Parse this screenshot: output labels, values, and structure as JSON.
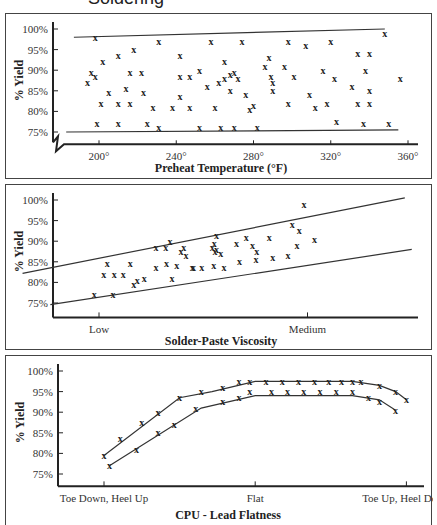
{
  "page": {
    "title": "Soldering"
  },
  "chart_data": [
    {
      "type": "scatter",
      "title": "",
      "xlabel": "Preheat Temperature (°F)",
      "ylabel": "% Yield",
      "xlim": [
        180,
        365
      ],
      "ylim": [
        72,
        100
      ],
      "x_ticks": [
        "200°",
        "240°",
        "280°",
        "320°",
        "360°"
      ],
      "y_ticks": [
        "100%",
        "95%",
        "90%",
        "85%",
        "80%",
        "75%"
      ],
      "marker": "x",
      "bounds": [
        {
          "name": "upper",
          "points": [
            [
              187,
              98
            ],
            [
              348,
              100
            ]
          ]
        },
        {
          "name": "lower",
          "points": [
            [
              183,
              75
            ],
            [
              355,
              75.5
            ]
          ]
        }
      ],
      "points": [
        [
          198,
          98
        ],
        [
          196,
          89.5
        ],
        [
          194,
          87
        ],
        [
          198,
          88.5
        ],
        [
          202,
          92
        ],
        [
          201,
          82
        ],
        [
          199,
          77
        ],
        [
          205,
          84.5
        ],
        [
          210,
          93.5
        ],
        [
          210,
          82
        ],
        [
          210,
          77
        ],
        [
          216,
          89.5
        ],
        [
          218,
          95
        ],
        [
          214,
          85.5
        ],
        [
          216,
          82
        ],
        [
          222,
          89.5
        ],
        [
          223,
          84.5
        ],
        [
          225,
          77
        ],
        [
          228,
          81
        ],
        [
          231,
          97
        ],
        [
          231,
          76
        ],
        [
          238,
          81
        ],
        [
          242,
          88.5
        ],
        [
          242,
          83.5
        ],
        [
          242,
          93.5
        ],
        [
          247,
          88.5
        ],
        [
          247,
          81
        ],
        [
          252,
          90
        ],
        [
          252,
          76
        ],
        [
          256,
          86
        ],
        [
          258,
          97
        ],
        [
          260,
          81
        ],
        [
          265,
          92
        ],
        [
          262,
          87
        ],
        [
          263,
          76
        ],
        [
          265,
          88
        ],
        [
          268,
          89
        ],
        [
          268,
          85
        ],
        [
          270,
          89.5
        ],
        [
          270,
          76
        ],
        [
          272,
          88
        ],
        [
          274,
          97
        ],
        [
          276,
          84
        ],
        [
          278,
          80.5
        ],
        [
          280,
          81.5
        ],
        [
          282,
          76
        ],
        [
          286,
          91
        ],
        [
          289,
          88.5
        ],
        [
          288,
          93
        ],
        [
          290,
          87
        ],
        [
          290,
          85
        ],
        [
          296,
          91
        ],
        [
          298,
          97
        ],
        [
          298,
          82
        ],
        [
          301,
          88.5
        ],
        [
          307,
          96
        ],
        [
          309,
          84
        ],
        [
          312,
          81
        ],
        [
          316,
          90
        ],
        [
          320,
          97
        ],
        [
          318,
          82
        ],
        [
          322,
          88
        ],
        [
          323,
          77.5
        ],
        [
          331,
          86
        ],
        [
          334,
          94
        ],
        [
          334,
          82
        ],
        [
          337,
          77
        ],
        [
          338,
          90
        ],
        [
          340,
          94
        ],
        [
          340,
          85
        ],
        [
          340,
          82
        ],
        [
          348,
          99
        ],
        [
          350,
          77
        ],
        [
          356,
          88
        ]
      ]
    },
    {
      "type": "scatter",
      "title": "",
      "xlabel": "Solder-Paste Viscosity",
      "ylabel": "% Yield",
      "x_ticks": [
        "Low",
        "Medium",
        "High"
      ],
      "y_ticks": [
        "100%",
        "95%",
        "90%",
        "85%",
        "80%",
        "75%"
      ],
      "ylim": [
        72,
        100
      ],
      "xlim": [
        -0.6,
        2.35
      ],
      "marker": "x",
      "bounds": [
        {
          "name": "upper",
          "points": [
            [
              -0.55,
              82.2
            ],
            [
              2.2,
              100.5
            ]
          ]
        },
        {
          "name": "lower",
          "points": [
            [
              -0.35,
              74.6
            ],
            [
              2.25,
              88
            ]
          ]
        }
      ],
      "points": [
        [
          -0.07,
          77
        ],
        [
          0.07,
          82
        ],
        [
          0.12,
          84.5
        ],
        [
          0.2,
          77
        ],
        [
          0.22,
          82
        ],
        [
          0.35,
          82
        ],
        [
          0.45,
          84.5
        ],
        [
          0.5,
          79.5
        ],
        [
          0.55,
          80.5
        ],
        [
          0.65,
          81
        ],
        [
          0.82,
          88.5
        ],
        [
          0.82,
          83.5
        ],
        [
          0.96,
          88.5
        ],
        [
          0.97,
          84.5
        ],
        [
          1.02,
          90
        ],
        [
          1.05,
          81
        ],
        [
          1.12,
          84
        ],
        [
          1.18,
          87.5
        ],
        [
          1.22,
          88.5
        ],
        [
          1.25,
          86.5
        ],
        [
          1.34,
          83.5
        ],
        [
          1.36,
          83.5
        ],
        [
          1.48,
          83.5
        ],
        [
          1.63,
          88.5
        ],
        [
          1.65,
          84
        ],
        [
          1.66,
          89.5
        ],
        [
          1.67,
          87.5
        ],
        [
          1.69,
          88
        ],
        [
          1.69,
          91.5
        ],
        [
          1.75,
          87
        ],
        [
          1.8,
          83.5
        ],
        [
          1.98,
          89.5
        ],
        [
          2.02,
          85
        ],
        [
          2.12,
          91
        ],
        [
          2.21,
          89
        ],
        [
          2.26,
          85.5
        ],
        [
          2.27,
          87.5
        ],
        [
          2.45,
          91
        ],
        [
          2.5,
          86
        ],
        [
          2.72,
          86.5
        ],
        [
          2.78,
          94
        ],
        [
          2.85,
          89
        ],
        [
          2.88,
          92.5
        ],
        [
          2.95,
          99
        ],
        [
          3.1,
          90.5
        ]
      ]
    },
    {
      "type": "scatter",
      "title": "",
      "xlabel": "CPU - Lead Flatness",
      "ylabel": "% Yield",
      "x_ticks": [
        "Toe Down, Heel Up",
        "Flat",
        "Toe Up, Heel Down"
      ],
      "y_ticks": [
        "100%",
        "95%",
        "90%",
        "85%",
        "80%",
        "75%"
      ],
      "ylim": [
        72,
        100
      ],
      "marker": "x",
      "bounds": [
        {
          "name": "upper",
          "points": [
            [
              0,
              79.5
            ],
            [
              0.7,
              93.5
            ],
            [
              1,
              95
            ],
            [
              1.4,
              97.5
            ],
            [
              2.3,
              97.5
            ],
            [
              2.55,
              96.5
            ],
            [
              2.7,
              95
            ],
            [
              2.8,
              93
            ]
          ]
        },
        {
          "name": "lower",
          "points": [
            [
              0.05,
              77
            ],
            [
              0.9,
              91
            ],
            [
              1.4,
              94
            ],
            [
              2.3,
              94
            ],
            [
              2.55,
              93
            ],
            [
              2.7,
              90.5
            ]
          ]
        }
      ],
      "upper_band_points": [
        [
          0,
          79.5
        ],
        [
          0.15,
          83.5
        ],
        [
          0.35,
          87.5
        ],
        [
          0.5,
          90
        ],
        [
          0.7,
          93.5
        ],
        [
          0.9,
          95
        ],
        [
          1.1,
          96
        ],
        [
          1.25,
          97.5
        ],
        [
          1.35,
          97.5
        ],
        [
          1.5,
          97.5
        ],
        [
          1.65,
          97.5
        ],
        [
          1.8,
          97.5
        ],
        [
          1.95,
          97.5
        ],
        [
          2.08,
          97.5
        ],
        [
          2.2,
          97.5
        ],
        [
          2.3,
          97.5
        ],
        [
          2.38,
          97.5
        ],
        [
          2.55,
          96.5
        ],
        [
          2.7,
          95
        ],
        [
          2.8,
          93
        ]
      ],
      "lower_band_points": [
        [
          0.05,
          77
        ],
        [
          0.3,
          81
        ],
        [
          0.5,
          85
        ],
        [
          0.65,
          87
        ],
        [
          0.85,
          91
        ],
        [
          1.1,
          92.5
        ],
        [
          1.25,
          93.5
        ],
        [
          1.35,
          95
        ],
        [
          1.55,
          95
        ],
        [
          1.7,
          95
        ],
        [
          1.85,
          95
        ],
        [
          2.0,
          95
        ],
        [
          2.15,
          95
        ],
        [
          2.3,
          95
        ],
        [
          2.45,
          93.5
        ],
        [
          2.55,
          92.5
        ],
        [
          2.7,
          90.5
        ]
      ]
    }
  ]
}
